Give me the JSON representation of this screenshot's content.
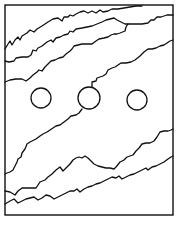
{
  "figure": {
    "width": 178,
    "height": 228,
    "background": "#ffffff",
    "ink": "#111111",
    "frame": {
      "x": 5,
      "y": 5,
      "w": 168,
      "h": 210
    },
    "upper_lines": [
      {
        "name": "upper-line-1",
        "points": [
          [
            5,
            49
          ],
          [
            8,
            44
          ],
          [
            10,
            41
          ],
          [
            12,
            45
          ],
          [
            15,
            40
          ],
          [
            18,
            37
          ],
          [
            20,
            40
          ],
          [
            22,
            36
          ],
          [
            27,
            33
          ],
          [
            30,
            30
          ],
          [
            34,
            32
          ],
          [
            37,
            29
          ],
          [
            42,
            26
          ],
          [
            48,
            22
          ],
          [
            53,
            19
          ],
          [
            58,
            18
          ],
          [
            62,
            21
          ],
          [
            64,
            17
          ],
          [
            68,
            17
          ],
          [
            70,
            15
          ],
          [
            73,
            16
          ],
          [
            76,
            14
          ],
          [
            80,
            12
          ],
          [
            84,
            11
          ],
          [
            88,
            13
          ],
          [
            92,
            11
          ],
          [
            96,
            13
          ],
          [
            100,
            10
          ],
          [
            103,
            12
          ],
          [
            108,
            11
          ],
          [
            112,
            9
          ],
          [
            118,
            9
          ],
          [
            124,
            8
          ],
          [
            130,
            7
          ],
          [
            136,
            6
          ],
          [
            142,
            6
          ]
        ]
      },
      {
        "name": "upper-line-2",
        "points": [
          [
            5,
            61
          ],
          [
            9,
            62
          ],
          [
            14,
            61
          ],
          [
            16,
            58
          ],
          [
            22,
            57
          ],
          [
            28,
            57
          ],
          [
            31,
            55
          ],
          [
            33,
            50
          ],
          [
            36,
            51
          ],
          [
            38,
            48
          ],
          [
            42,
            46
          ],
          [
            47,
            42
          ],
          [
            51,
            40
          ],
          [
            53,
            42
          ],
          [
            56,
            38
          ],
          [
            60,
            37
          ],
          [
            64,
            35
          ],
          [
            68,
            34
          ],
          [
            70,
            31
          ],
          [
            73,
            32
          ],
          [
            76,
            29
          ],
          [
            82,
            28
          ],
          [
            87,
            27
          ],
          [
            92,
            26
          ],
          [
            97,
            24
          ],
          [
            102,
            22
          ],
          [
            106,
            20
          ],
          [
            110,
            19
          ],
          [
            114,
            18
          ],
          [
            117,
            20
          ],
          [
            121,
            22
          ],
          [
            125,
            24
          ],
          [
            128,
            24
          ],
          [
            131,
            24
          ],
          [
            136,
            24
          ],
          [
            142,
            24
          ],
          [
            148,
            23
          ],
          [
            151,
            20
          ],
          [
            154,
            20
          ],
          [
            157,
            17
          ],
          [
            161,
            17
          ],
          [
            164,
            16
          ],
          [
            167,
            15
          ],
          [
            173,
            15
          ]
        ]
      },
      {
        "name": "upper-line-3",
        "points": [
          [
            5,
            82
          ],
          [
            10,
            80
          ],
          [
            16,
            79
          ],
          [
            22,
            79
          ],
          [
            26,
            81
          ],
          [
            30,
            78
          ],
          [
            33,
            75
          ],
          [
            37,
            72
          ],
          [
            39,
            70
          ],
          [
            42,
            71
          ],
          [
            45,
            67
          ],
          [
            48,
            64
          ],
          [
            51,
            61
          ],
          [
            55,
            60
          ],
          [
            59,
            58
          ],
          [
            63,
            57
          ],
          [
            66,
            54
          ],
          [
            70,
            51
          ],
          [
            72,
            49
          ],
          [
            74,
            46
          ],
          [
            78,
            45
          ],
          [
            82,
            44
          ],
          [
            86,
            44
          ],
          [
            92,
            44
          ],
          [
            96,
            41
          ],
          [
            99,
            39
          ],
          [
            104,
            38
          ],
          [
            108,
            37
          ],
          [
            111,
            35
          ],
          [
            114,
            34
          ],
          [
            117,
            34
          ],
          [
            120,
            33
          ],
          [
            125,
            31
          ],
          [
            126,
            27
          ],
          [
            128,
            24
          ]
        ]
      }
    ],
    "circles": [
      {
        "name": "left-circle",
        "cx": 41,
        "cy": 98,
        "r": 10
      },
      {
        "name": "middle-circle",
        "cx": 89,
        "cy": 98,
        "r": 11
      },
      {
        "name": "right-circle",
        "cx": 137,
        "cy": 100,
        "r": 10
      }
    ],
    "connector_line": {
      "name": "middle-circle-upper-connector",
      "points": [
        [
          92,
          87
        ],
        [
          92,
          82
        ],
        [
          96,
          81
        ],
        [
          97,
          78
        ],
        [
          103,
          76
        ],
        [
          106,
          74
        ],
        [
          108,
          70
        ],
        [
          112,
          68
        ],
        [
          115,
          67
        ],
        [
          118,
          65
        ],
        [
          121,
          63
        ],
        [
          126,
          63
        ],
        [
          131,
          62
        ],
        [
          135,
          60
        ],
        [
          140,
          56
        ],
        [
          144,
          52
        ],
        [
          148,
          49
        ],
        [
          152,
          49
        ],
        [
          156,
          48
        ],
        [
          160,
          46
        ],
        [
          164,
          45
        ],
        [
          167,
          43
        ],
        [
          170,
          41
        ],
        [
          173,
          40
        ]
      ]
    },
    "lower_lines": [
      {
        "name": "lower-line-1",
        "points": [
          [
            82,
            109
          ],
          [
            79,
            113
          ],
          [
            76,
            115
          ],
          [
            71,
            116
          ],
          [
            68,
            119
          ],
          [
            64,
            122
          ],
          [
            60,
            125
          ],
          [
            56,
            126
          ],
          [
            53,
            128
          ],
          [
            50,
            130
          ],
          [
            47,
            132
          ],
          [
            43,
            134
          ],
          [
            40,
            136
          ],
          [
            36,
            139
          ],
          [
            30,
            142
          ],
          [
            27,
            144
          ],
          [
            25,
            149
          ],
          [
            22,
            153
          ],
          [
            21,
            157
          ],
          [
            18,
            159
          ],
          [
            17,
            162
          ],
          [
            15,
            166
          ],
          [
            13,
            170
          ],
          [
            10,
            172
          ],
          [
            7,
            173
          ],
          [
            5,
            174
          ]
        ]
      },
      {
        "name": "lower-line-2",
        "points": [
          [
            5,
            191
          ],
          [
            10,
            192
          ],
          [
            15,
            195
          ],
          [
            18,
            191
          ],
          [
            22,
            188
          ],
          [
            28,
            188
          ],
          [
            36,
            188
          ],
          [
            40,
            182
          ],
          [
            45,
            180
          ],
          [
            48,
            177
          ],
          [
            52,
            174
          ],
          [
            56,
            170
          ],
          [
            60,
            167
          ],
          [
            63,
            171
          ],
          [
            66,
            168
          ],
          [
            70,
            164
          ],
          [
            73,
            160
          ],
          [
            76,
            158
          ],
          [
            79,
            157
          ],
          [
            82,
            158
          ],
          [
            85,
            156
          ],
          [
            88,
            158
          ],
          [
            91,
            161
          ],
          [
            94,
            164
          ],
          [
            98,
            166
          ],
          [
            102,
            167
          ],
          [
            106,
            168
          ],
          [
            110,
            168
          ],
          [
            114,
            169
          ],
          [
            116,
            167
          ],
          [
            120,
            162
          ],
          [
            124,
            160
          ],
          [
            127,
            157
          ],
          [
            130,
            156
          ],
          [
            133,
            155
          ],
          [
            136,
            151
          ],
          [
            139,
            148
          ],
          [
            142,
            144
          ],
          [
            146,
            143
          ],
          [
            150,
            143
          ],
          [
            154,
            141
          ],
          [
            157,
            137
          ],
          [
            160,
            132
          ],
          [
            164,
            131
          ],
          [
            168,
            131
          ],
          [
            171,
            130
          ],
          [
            173,
            129
          ]
        ]
      },
      {
        "name": "lower-line-3",
        "points": [
          [
            5,
            204
          ],
          [
            10,
            201
          ],
          [
            14,
            199
          ],
          [
            18,
            203
          ],
          [
            22,
            201
          ],
          [
            26,
            199
          ],
          [
            30,
            198
          ],
          [
            34,
            197
          ],
          [
            38,
            200
          ],
          [
            42,
            198
          ],
          [
            46,
            195
          ],
          [
            50,
            196
          ],
          [
            54,
            199
          ],
          [
            58,
            197
          ],
          [
            62,
            195
          ],
          [
            66,
            193
          ],
          [
            70,
            191
          ],
          [
            74,
            191
          ],
          [
            77,
            189
          ],
          [
            80,
            192
          ],
          [
            84,
            189
          ],
          [
            88,
            187
          ],
          [
            92,
            186
          ],
          [
            96,
            184
          ],
          [
            100,
            183
          ],
          [
            104,
            181
          ],
          [
            108,
            179
          ],
          [
            112,
            177
          ],
          [
            116,
            178
          ],
          [
            119,
            176
          ],
          [
            122,
            179
          ],
          [
            126,
            177
          ],
          [
            130,
            175
          ],
          [
            134,
            174
          ],
          [
            138,
            172
          ],
          [
            142,
            170
          ],
          [
            146,
            168
          ],
          [
            148,
            170
          ],
          [
            152,
            167
          ],
          [
            156,
            166
          ],
          [
            160,
            164
          ],
          [
            164,
            162
          ],
          [
            168,
            159
          ],
          [
            171,
            157
          ],
          [
            173,
            156
          ]
        ]
      }
    ]
  }
}
